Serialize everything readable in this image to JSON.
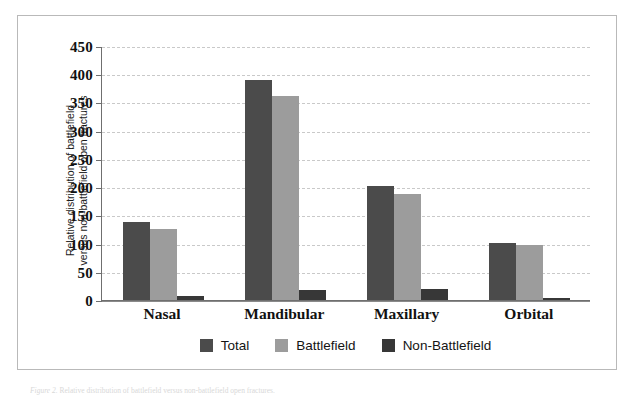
{
  "figure": {
    "y_axis_title_lines": [
      "Relative distribution of battlefield",
      "versus non-battlefield open fractures"
    ],
    "caption_label": "Figure 2.",
    "caption_text": "Relative distribution of battlefield versus non-battlefield open fractures.",
    "colors": {
      "total": "#4b4b4b",
      "battlefield": "#9c9c9c",
      "non_battlefield": "#373737",
      "gridline": "#c9c9c9",
      "axis": "#6f6f6f",
      "frame": "#b9b9b9"
    }
  },
  "chart_data": {
    "type": "bar",
    "title": "",
    "xlabel": "",
    "ylabel": "Relative distribution of battlefield versus non-battlefield open fractures",
    "categories": [
      "Nasal",
      "Mandibular",
      "Maxillary",
      "Orbital"
    ],
    "series": [
      {
        "name": "Total",
        "values": [
          139,
          390,
          202,
          101
        ]
      },
      {
        "name": "Battlefield",
        "values": [
          125,
          362,
          188,
          97
        ]
      },
      {
        "name": "Non-Battlefield",
        "values": [
          7,
          17,
          20,
          4
        ]
      }
    ],
    "ylim": [
      0,
      450
    ],
    "ytick_labels": [
      "0",
      "50",
      "100",
      "150",
      "200",
      "250",
      "300",
      "350",
      "400",
      "450"
    ],
    "ytick_values": [
      0,
      50,
      100,
      150,
      200,
      250,
      300,
      350,
      400,
      450
    ],
    "grid": true,
    "grid_style": "dashed-horizontal",
    "legend_position": "bottom-center"
  }
}
